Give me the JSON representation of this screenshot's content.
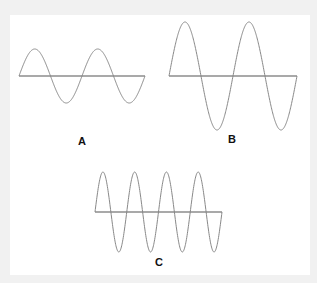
{
  "diagram": {
    "waves": [
      {
        "id": "A",
        "label": "A",
        "axis_y": 76,
        "x_start": 19,
        "x_end": 145,
        "amplitude": 27,
        "cycles": 2,
        "label_x": 82,
        "label_y": 141
      },
      {
        "id": "B",
        "label": "B",
        "axis_y": 76,
        "x_start": 169,
        "x_end": 297,
        "amplitude": 54,
        "cycles": 2,
        "label_x": 232,
        "label_y": 139
      },
      {
        "id": "C",
        "label": "C",
        "axis_y": 212,
        "x_start": 95,
        "x_end": 222,
        "amplitude": 40,
        "cycles": 4,
        "label_x": 159,
        "label_y": 262
      }
    ],
    "colors": {
      "background": "#f1f1f1",
      "panel": "#ffffff",
      "wave": "#888888",
      "axis": "#555555",
      "label": "#111111"
    }
  }
}
